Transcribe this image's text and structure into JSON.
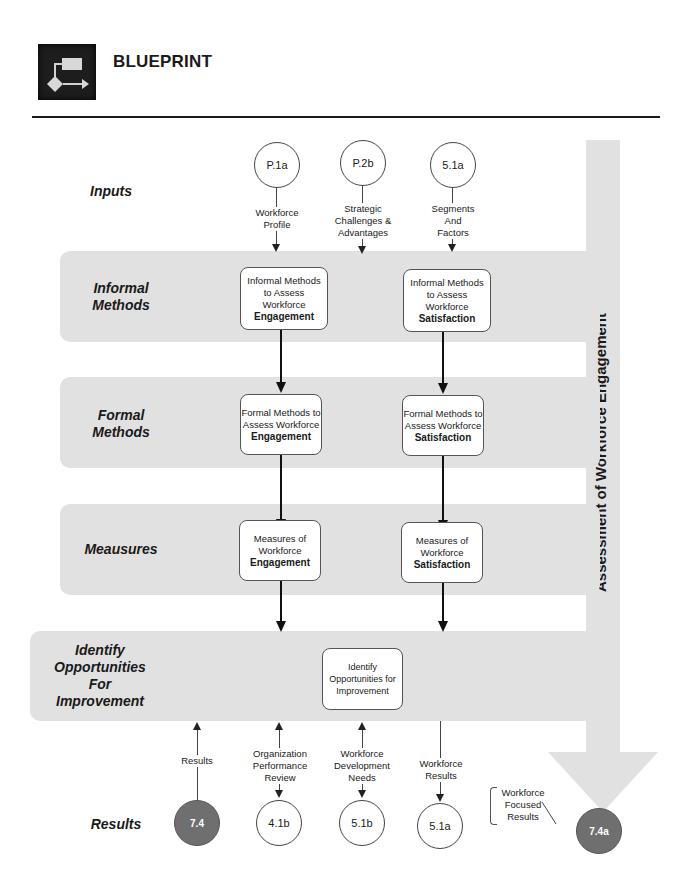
{
  "header": {
    "icon": "flowchart-blueprint-icon",
    "title": "BLUEPRINT"
  },
  "side_band": {
    "label": "Assessment of Workforce Engagement",
    "color": "#e1e1e1"
  },
  "rows": {
    "inputs": "Inputs",
    "informal": [
      "Informal",
      "Methods"
    ],
    "formal": [
      "Formal",
      "Methods"
    ],
    "measures": "Meausures",
    "identify": [
      "Identify",
      "Opportunities",
      "For",
      "Improvement"
    ],
    "results": "Results"
  },
  "inputs": [
    {
      "id": "P.1a",
      "label": [
        "Workforce",
        "Profile"
      ]
    },
    {
      "id": "P.2b",
      "label": [
        "Strategic",
        "Challenges &",
        "Advantages"
      ]
    },
    {
      "id": "5.1a",
      "label": [
        "Segments",
        "And",
        "Factors"
      ]
    }
  ],
  "boxes": {
    "informal_engagement": {
      "lines": [
        "Informal Methods",
        "to Assess",
        "Workforce"
      ],
      "bold": "Engagement"
    },
    "informal_satisfaction": {
      "lines": [
        "Informal Methods",
        "to Assess",
        "Workforce"
      ],
      "bold": "Satisfaction"
    },
    "formal_engagement": {
      "lines": [
        "Formal Methods to",
        "Assess Workforce"
      ],
      "bold": "Engagement"
    },
    "formal_satisfaction": {
      "lines": [
        "Formal Methods to",
        "Assess Workforce"
      ],
      "bold": "Satisfaction"
    },
    "measures_engagement": {
      "lines": [
        "Measures of",
        "Workforce"
      ],
      "bold": "Engagement"
    },
    "measures_satisfaction": {
      "lines": [
        "Measures of",
        "Workforce"
      ],
      "bold": "Satisfaction"
    },
    "identify": {
      "lines": [
        "Identify",
        "Opportunities for",
        "Improvement"
      ]
    }
  },
  "outputs": [
    {
      "id": "7.4",
      "label": [
        "Results"
      ],
      "dark": true,
      "direction": "up"
    },
    {
      "id": "4.1b",
      "label": [
        "Organization",
        "Performance",
        "Review"
      ],
      "dark": false,
      "direction": "both"
    },
    {
      "id": "5.1b",
      "label": [
        "Workforce",
        "Development",
        "Needs"
      ],
      "dark": false,
      "direction": "both"
    },
    {
      "id": "5.1a",
      "label": [
        "Workforce",
        "Results"
      ],
      "dark": false,
      "direction": "down"
    }
  ],
  "final": {
    "id": "7.4a",
    "callout": [
      "Workforce",
      "Focused",
      "Results"
    ],
    "color": "#6f6f6f"
  }
}
